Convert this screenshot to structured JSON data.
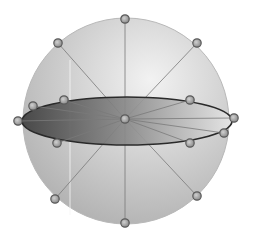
{
  "diagram": {
    "type": "sphere-with-equatorial-disk",
    "colors": {
      "background": "#ffffff",
      "sphere_light": "#f2f2f2",
      "sphere_dark": "#a9a9a9",
      "sphere_outline": "#b8b8b8",
      "disk_dark": "#3f3f3f",
      "disk_mid": "#8a8a8a",
      "disk_light": "#e6e6e6",
      "disk_outline": "#2a2a2a",
      "spoke": "#7a7a7a",
      "node_fill": "#8c8c8c",
      "node_ring": "#5a5a5a"
    },
    "sphere": {
      "cx": 126,
      "cy": 121,
      "r": 103
    },
    "disk": {
      "cx": 127,
      "cy": 121,
      "rx": 105,
      "ry": 24
    },
    "center_node": {
      "x": 125,
      "y": 119
    },
    "nodes": [
      {
        "id": "top",
        "x": 125,
        "y": 19
      },
      {
        "id": "top-left",
        "x": 58,
        "y": 43
      },
      {
        "id": "top-right",
        "x": 197,
        "y": 43
      },
      {
        "id": "left",
        "x": 18,
        "y": 121
      },
      {
        "id": "disk-left-upper",
        "x": 33,
        "y": 106
      },
      {
        "id": "disk-back-left",
        "x": 64,
        "y": 100
      },
      {
        "id": "disk-back-right",
        "x": 190,
        "y": 100
      },
      {
        "id": "right",
        "x": 234,
        "y": 118
      },
      {
        "id": "disk-right-lower",
        "x": 224,
        "y": 133
      },
      {
        "id": "disk-front-left",
        "x": 57,
        "y": 143
      },
      {
        "id": "disk-front-right",
        "x": 190,
        "y": 143
      },
      {
        "id": "bottom-left",
        "x": 55,
        "y": 199
      },
      {
        "id": "bottom-right",
        "x": 197,
        "y": 196
      },
      {
        "id": "bottom",
        "x": 125,
        "y": 223
      }
    ]
  }
}
